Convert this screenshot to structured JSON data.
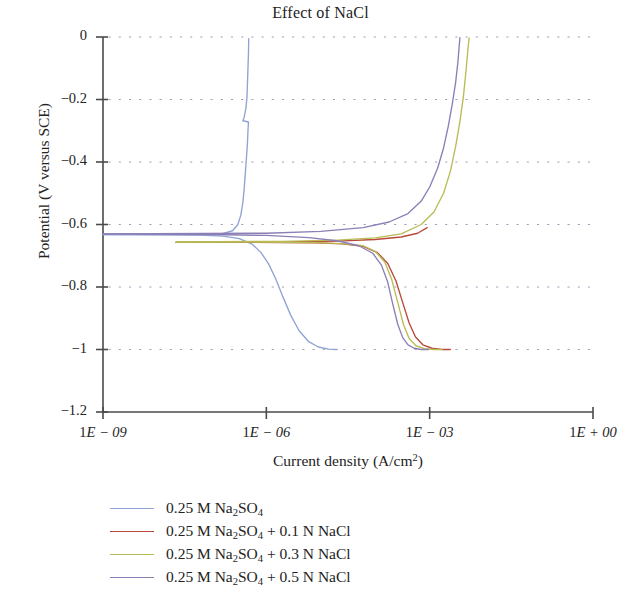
{
  "chart_data": {
    "type": "line",
    "title": "Effect of NaCl",
    "xlabel": "Current density (A/cm2)",
    "ylabel": "Potential (V versus SCE)",
    "x_scale": "log",
    "xlim": [
      1e-09,
      1.0
    ],
    "ylim": [
      -1.2,
      0
    ],
    "xticks": [
      "1E − 09",
      "1E − 06",
      "1E − 03",
      "1E + 00"
    ],
    "xtick_values": [
      1e-09,
      1e-06,
      0.001,
      1.0
    ],
    "yticks": [
      "0",
      "−0.2",
      "−0.4",
      "−0.6",
      "−0.8",
      "−1",
      "−1.2"
    ],
    "ytick_values": [
      0,
      -0.2,
      -0.4,
      -0.6,
      -0.8,
      -1,
      -1.2
    ],
    "grid": "horizontal-dotted",
    "legend_position": "below-plot",
    "series": [
      {
        "name": "0.25 M Na2SO4",
        "color": "#8fa3d4",
        "ecorr": -0.63,
        "points": [
          [
            1e-09,
            -0.632
          ],
          [
            4e-09,
            -0.632
          ],
          [
            1.6e-08,
            -0.633
          ],
          [
            6e-08,
            -0.634
          ],
          [
            1.6e-07,
            -0.637
          ],
          [
            3.2e-07,
            -0.645
          ],
          [
            5.5e-07,
            -0.663
          ],
          [
            8e-07,
            -0.69
          ],
          [
            1.1e-06,
            -0.726
          ],
          [
            1.5e-06,
            -0.775
          ],
          [
            2e-06,
            -0.83
          ],
          [
            2.8e-06,
            -0.89
          ],
          [
            4e-06,
            -0.94
          ],
          [
            6e-06,
            -0.975
          ],
          [
            9e-06,
            -0.992
          ],
          [
            1.4e-05,
            -0.999
          ],
          [
            2e-05,
            -1.0
          ]
        ],
        "anodic_points": [
          [
            1e-09,
            -0.632
          ],
          [
            6e-08,
            -0.633
          ],
          [
            1.5e-07,
            -0.63
          ],
          [
            2.4e-07,
            -0.62
          ],
          [
            3e-07,
            -0.6
          ],
          [
            3.4e-07,
            -0.57
          ],
          [
            3.7e-07,
            -0.53
          ],
          [
            3.9e-07,
            -0.49
          ],
          [
            4.1e-07,
            -0.44
          ],
          [
            4.3e-07,
            -0.39
          ],
          [
            4.5e-07,
            -0.34
          ],
          [
            4.6e-07,
            -0.3
          ],
          [
            4.7e-07,
            -0.272
          ],
          [
            3.7e-07,
            -0.268
          ],
          [
            3.9e-07,
            -0.258
          ],
          [
            4.2e-07,
            -0.23
          ],
          [
            4.4e-07,
            -0.195
          ],
          [
            4.5e-07,
            -0.15
          ],
          [
            4.6e-07,
            -0.1
          ],
          [
            4.7e-07,
            -0.05
          ],
          [
            4.75e-07,
            -0.005
          ]
        ]
      },
      {
        "name": "0.25 M Na2SO4 + 0.1 N NaCl",
        "color": "#b8493a",
        "ecorr": -0.655,
        "points": [
          [
            2.2e-08,
            -0.657
          ],
          [
            1e-07,
            -0.657
          ],
          [
            5e-07,
            -0.657
          ],
          [
            2e-06,
            -0.658
          ],
          [
            8e-06,
            -0.659
          ],
          [
            2.5e-05,
            -0.662
          ],
          [
            6e-05,
            -0.67
          ],
          [
            0.00011,
            -0.69
          ],
          [
            0.00017,
            -0.725
          ],
          [
            0.00024,
            -0.78
          ],
          [
            0.00032,
            -0.85
          ],
          [
            0.00042,
            -0.915
          ],
          [
            0.00055,
            -0.96
          ],
          [
            0.00075,
            -0.985
          ],
          [
            0.0011,
            -0.996
          ],
          [
            0.0017,
            -1.0
          ],
          [
            0.0024,
            -1.0
          ]
        ],
        "anodic_points": [
          [
            2.2e-08,
            -0.657
          ],
          [
            2e-06,
            -0.656
          ],
          [
            2e-05,
            -0.653
          ],
          [
            0.0001,
            -0.648
          ],
          [
            0.0003,
            -0.64
          ],
          [
            0.0006,
            -0.628
          ],
          [
            0.0009,
            -0.61
          ]
        ]
      },
      {
        "name": "0.25 M Na2SO4 + 0.3 N NaCl",
        "color": "#b9bc56",
        "ecorr": -0.655,
        "points": [
          [
            2.2e-08,
            -0.656
          ],
          [
            1e-07,
            -0.656
          ],
          [
            5e-07,
            -0.656
          ],
          [
            2e-06,
            -0.657
          ],
          [
            8e-06,
            -0.658
          ],
          [
            2.5e-05,
            -0.661
          ],
          [
            6e-05,
            -0.668
          ],
          [
            0.0001,
            -0.686
          ],
          [
            0.00015,
            -0.72
          ],
          [
            0.0002,
            -0.775
          ],
          [
            0.00026,
            -0.85
          ],
          [
            0.00033,
            -0.92
          ],
          [
            0.00042,
            -0.965
          ],
          [
            0.00056,
            -0.988
          ],
          [
            0.0008,
            -0.997
          ],
          [
            0.0012,
            -1.0
          ],
          [
            0.0017,
            -1.0
          ]
        ],
        "anodic_points": [
          [
            2.2e-08,
            -0.656
          ],
          [
            2e-06,
            -0.654
          ],
          [
            2e-05,
            -0.65
          ],
          [
            0.0001,
            -0.643
          ],
          [
            0.0003,
            -0.63
          ],
          [
            0.0007,
            -0.6
          ],
          [
            0.0012,
            -0.56
          ],
          [
            0.0018,
            -0.5
          ],
          [
            0.0024,
            -0.43
          ],
          [
            0.003,
            -0.35
          ],
          [
            0.0036,
            -0.27
          ],
          [
            0.0042,
            -0.185
          ],
          [
            0.0047,
            -0.1
          ],
          [
            0.0051,
            -0.03
          ],
          [
            0.0053,
            -0.003
          ]
        ]
      },
      {
        "name": "0.25 M Na2SO4 + 0.5 N NaCl",
        "color": "#8b7fb5",
        "ecorr": -0.63,
        "points": [
          [
            1e-09,
            -0.63
          ],
          [
            1e-08,
            -0.631
          ],
          [
            1e-07,
            -0.632
          ],
          [
            1e-06,
            -0.635
          ],
          [
            6e-06,
            -0.642
          ],
          [
            2e-05,
            -0.652
          ],
          [
            5e-05,
            -0.668
          ],
          [
            9e-05,
            -0.692
          ],
          [
            0.00013,
            -0.73
          ],
          [
            0.00017,
            -0.785
          ],
          [
            0.00021,
            -0.855
          ],
          [
            0.00026,
            -0.92
          ],
          [
            0.00032,
            -0.962
          ],
          [
            0.0004,
            -0.985
          ],
          [
            0.00052,
            -0.996
          ],
          [
            0.0007,
            -1.0
          ],
          [
            0.00095,
            -1.0
          ]
        ],
        "anodic_points": [
          [
            1e-09,
            -0.63
          ],
          [
            1e-06,
            -0.628
          ],
          [
            1e-05,
            -0.622
          ],
          [
            6e-05,
            -0.61
          ],
          [
            0.00018,
            -0.592
          ],
          [
            0.0004,
            -0.565
          ],
          [
            0.0007,
            -0.525
          ],
          [
            0.001,
            -0.48
          ],
          [
            0.0014,
            -0.42
          ],
          [
            0.0018,
            -0.355
          ],
          [
            0.0022,
            -0.285
          ],
          [
            0.0026,
            -0.215
          ],
          [
            0.003,
            -0.145
          ],
          [
            0.0033,
            -0.08
          ],
          [
            0.0035,
            -0.025
          ],
          [
            0.0036,
            -0.002
          ]
        ]
      }
    ]
  },
  "legend": {
    "items": [
      {
        "color": "#8fa3d4",
        "html": "0.25 M Na<sub>2</sub>SO<sub>4</sub>"
      },
      {
        "color": "#b8493a",
        "html": "0.25 M Na<sub>2</sub>SO<sub>4</sub> + 0.1 N NaCl"
      },
      {
        "color": "#b9bc56",
        "html": "0.25 M Na<sub>2</sub>SO<sub>4</sub> + 0.3 N NaCl"
      },
      {
        "color": "#8b7fb5",
        "html": "0.25 M Na<sub>2</sub>SO<sub>4</sub> + 0.5 N NaCl"
      }
    ]
  },
  "axis_text": {
    "title": "Effect of NaCl",
    "ylabel": "Potential (V versus SCE)",
    "xlabel_html": "Current density (A/cm<sup>2</sup>)"
  }
}
